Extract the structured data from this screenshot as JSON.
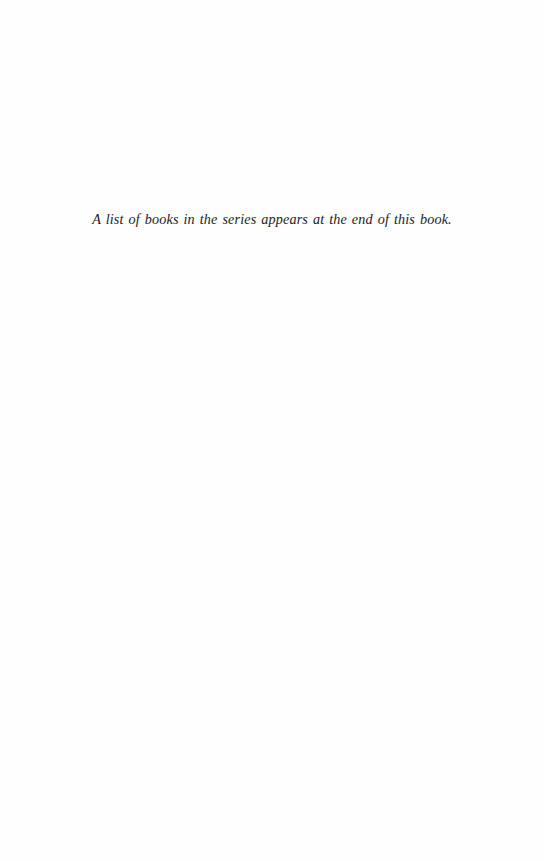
{
  "page": {
    "series_note": "A list of books in the series appears at the end of this book."
  },
  "colors": {
    "background": "#fefefe",
    "text": "#1c1c1c"
  }
}
